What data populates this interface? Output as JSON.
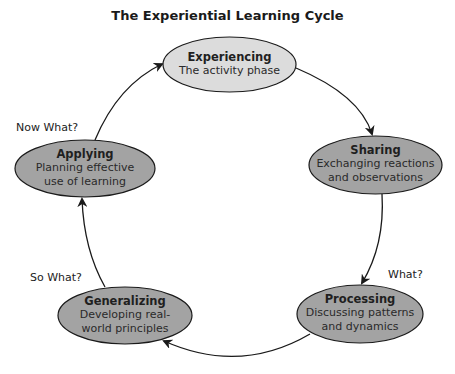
{
  "title": "The Experiential Learning Cycle",
  "colors": {
    "top_fill": "#dcdcdc",
    "node_fill": "#a3a3a3",
    "stroke": "#1a1a1a",
    "background": "#ffffff"
  },
  "nodes": [
    {
      "name": "Experiencing",
      "desc": "The activity phase"
    },
    {
      "name": "Sharing",
      "desc": "Exchanging reactions and observations"
    },
    {
      "name": "Processing",
      "desc": "Discussing patterns and dynamics"
    },
    {
      "name": "Generalizing",
      "desc": "Developing real-world principles"
    },
    {
      "name": "Applying",
      "desc": "Planning effective use of learning"
    }
  ],
  "questions": {
    "what": "What?",
    "so_what": "So What?",
    "now_what": "Now What?"
  }
}
